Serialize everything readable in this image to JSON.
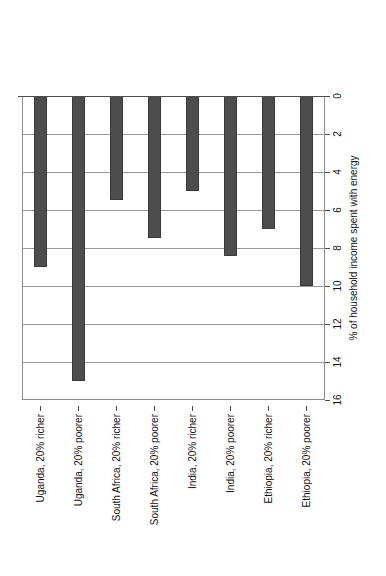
{
  "chart_data": {
    "type": "bar",
    "orientation": "vertical-rotated",
    "title": "",
    "xlabel": "",
    "ylabel": "% of household income spent with energy",
    "ylim": [
      0,
      16
    ],
    "ytick_step": 2,
    "grid": true,
    "legend": "none",
    "bar_color": "#4d4d4d",
    "categories": [
      "Uganda, 20% richer",
      "Uganda, 20% poorer",
      "South Africa, 20% richer",
      "South Africa, 20% poorer",
      "India, 20% richer",
      "India, 20% poorer",
      "Ethiopia, 20% richer",
      "Ethiopia, 20% poorer"
    ],
    "values": [
      9.0,
      15.0,
      5.5,
      7.5,
      5.0,
      8.4,
      7.0,
      10.0
    ],
    "tick_labels": [
      "0",
      "2",
      "4",
      "6",
      "8",
      "10",
      "12",
      "14",
      "16"
    ],
    "tick_values": [
      0,
      2,
      4,
      6,
      8,
      10,
      12,
      14,
      16
    ]
  }
}
